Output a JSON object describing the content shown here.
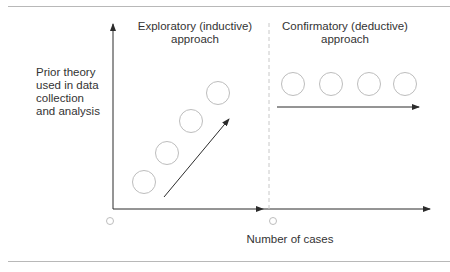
{
  "diagram": {
    "y_axis_label": "Prior theory used in data collection and analysis",
    "x_axis_label": "Number of cases",
    "panels": [
      {
        "id": "exploratory",
        "title": "Exploratory (inductive) approach",
        "cases": 4,
        "trend": "increasing"
      },
      {
        "id": "confirmatory",
        "title": "Confirmatory (deductive) approach",
        "cases": 4,
        "trend": "constant"
      }
    ],
    "colors": {
      "axis": "#2b2b2b",
      "circle": "#bdbdbd",
      "divider": "#c8c8c8",
      "rule": "#b8b8b8",
      "text": "#333333"
    }
  }
}
